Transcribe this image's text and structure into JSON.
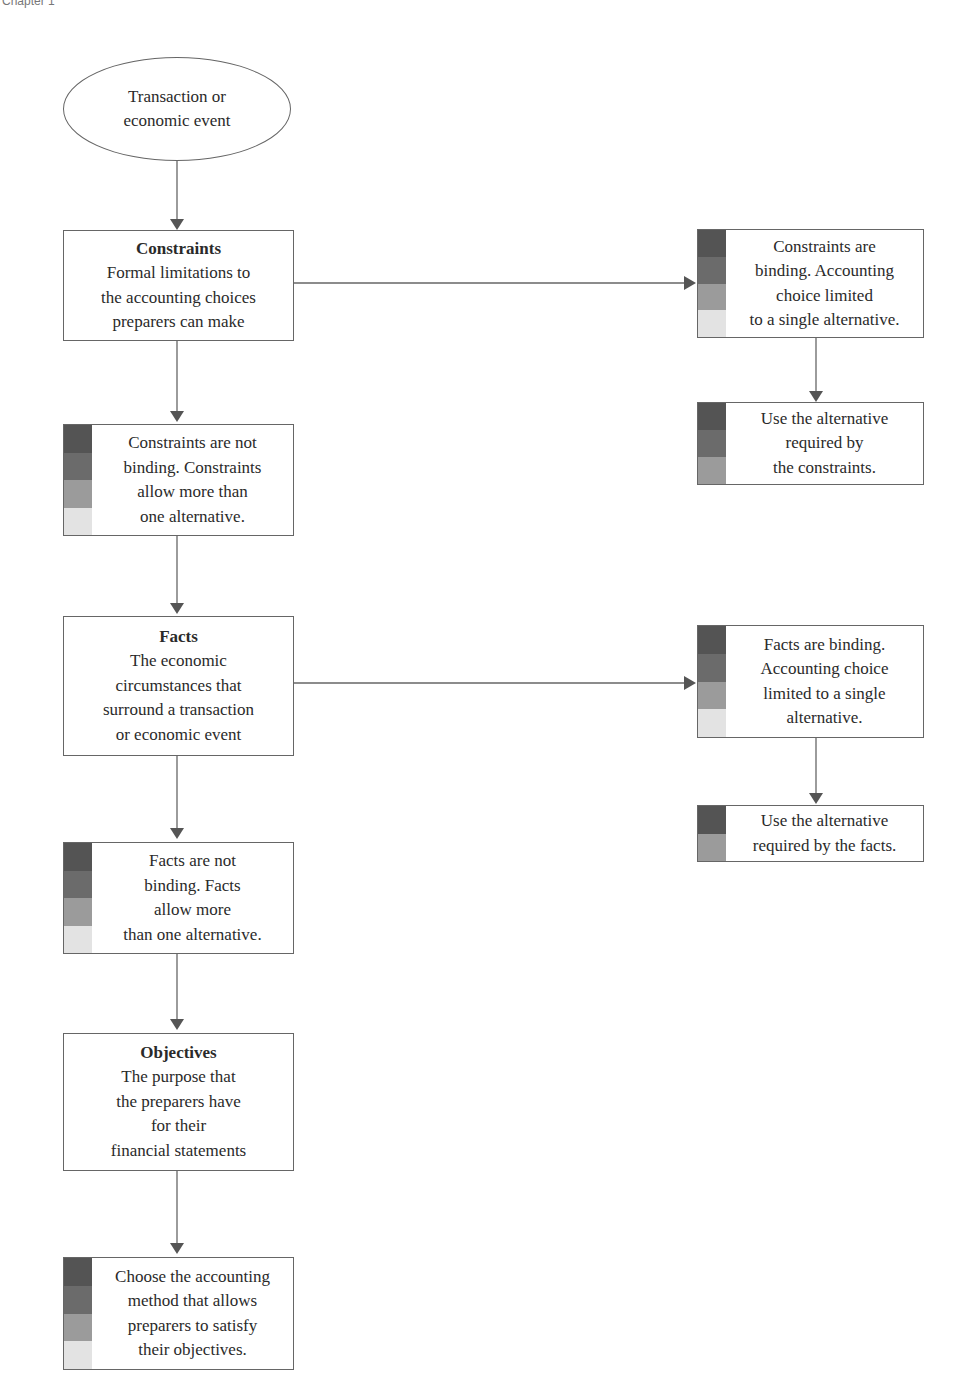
{
  "header": {
    "text": "Chapter 1"
  },
  "colors": {
    "line": "#666666",
    "stripes4": [
      "#545454",
      "#6b6b6b",
      "#9b9b9b",
      "#e3e3e3"
    ],
    "stripes3": [
      "#545454",
      "#6b6b6b",
      "#9b9b9b"
    ],
    "stripes2": [
      "#545454",
      "#9b9b9b"
    ]
  },
  "nodes": {
    "start": {
      "lines": [
        "Transaction or",
        "economic event"
      ]
    },
    "constraints": {
      "title": "Constraints",
      "lines": [
        "Formal limitations to",
        "the accounting choices",
        "preparers can make"
      ]
    },
    "constraints_binding": {
      "lines": [
        "Constraints are",
        "binding. Accounting",
        "choice limited",
        "to a single alternative."
      ]
    },
    "constraints_use": {
      "lines": [
        "Use the alternative",
        "required by",
        "the constraints."
      ]
    },
    "constraints_not_binding": {
      "lines": [
        "Constraints are not",
        "binding. Constraints",
        "allow more than",
        "one alternative."
      ]
    },
    "facts": {
      "title": "Facts",
      "lines": [
        "The economic",
        "circumstances that",
        "surround a transaction",
        "or economic event"
      ]
    },
    "facts_binding": {
      "lines": [
        "Facts are binding.",
        "Accounting choice",
        "limited to a single",
        "alternative."
      ]
    },
    "facts_use": {
      "lines": [
        "Use the alternative",
        "required by the facts."
      ]
    },
    "facts_not_binding": {
      "lines": [
        "Facts are not",
        "binding. Facts",
        "allow more",
        "than one alternative."
      ]
    },
    "objectives": {
      "title": "Objectives",
      "lines": [
        "The purpose that",
        "the preparers have",
        "for their",
        "financial statements"
      ]
    },
    "choose": {
      "lines": [
        "Choose the accounting",
        "method that allows",
        "preparers to satisfy",
        "their objectives."
      ]
    }
  }
}
